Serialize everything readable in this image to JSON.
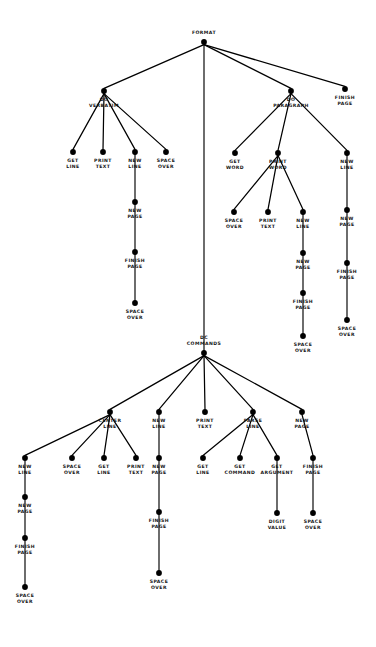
{
  "figure": {
    "title": "THE FORMAT PRO GRAM TREE",
    "type": "hierarchy-tree-diagram",
    "node_color": "#000000",
    "edge_color": "#000000",
    "background": "#ffffff"
  },
  "tree": {
    "root": "FORMAT",
    "nodes": [
      {
        "id": "n0",
        "label": "FORMAT",
        "x": 204,
        "y": 42,
        "label_dy": -12
      },
      {
        "id": "n1",
        "label": "DO\nVERBATIM",
        "x": 104,
        "y": 91,
        "label_dy": 6
      },
      {
        "id": "n2",
        "label": "DC\nCOMMANDS",
        "x": 204,
        "y": 353,
        "label_dy": -18
      },
      {
        "id": "n3",
        "label": "DO\nPARAGRAPH",
        "x": 291,
        "y": 91,
        "label_dy": 6
      },
      {
        "id": "n4",
        "label": "FINISH\nPAGE",
        "x": 345,
        "y": 89,
        "label_dy": 6
      },
      {
        "id": "v1",
        "label": "GET\nLINE",
        "x": 73,
        "y": 152,
        "label_dy": 6
      },
      {
        "id": "v2",
        "label": "PRINT\nTEXT",
        "x": 103,
        "y": 152,
        "label_dy": 6
      },
      {
        "id": "v3",
        "label": "NEW\nLINE",
        "x": 135,
        "y": 152,
        "label_dy": 6
      },
      {
        "id": "v4",
        "label": "SPACE\nOVER",
        "x": 166,
        "y": 152,
        "label_dy": 6
      },
      {
        "id": "v3a",
        "label": "NEW\nPAGE",
        "x": 135,
        "y": 202,
        "label_dy": 6
      },
      {
        "id": "v3b",
        "label": "FINISH\nPAGE",
        "x": 135,
        "y": 252,
        "label_dy": 6
      },
      {
        "id": "v3c",
        "label": "SPACE\nOVER",
        "x": 135,
        "y": 303,
        "label_dy": 6
      },
      {
        "id": "p1",
        "label": "GET\nWORD",
        "x": 235,
        "y": 153,
        "label_dy": 6
      },
      {
        "id": "p2",
        "label": "PRINT\nWORD",
        "x": 278,
        "y": 153,
        "label_dy": 6
      },
      {
        "id": "p3",
        "label": "NEW\nLINE",
        "x": 347,
        "y": 153,
        "label_dy": 6
      },
      {
        "id": "p2a",
        "label": "SPACE\nOVER",
        "x": 234,
        "y": 212,
        "label_dy": 6
      },
      {
        "id": "p2b",
        "label": "PRINT\nTEXT",
        "x": 268,
        "y": 212,
        "label_dy": 6
      },
      {
        "id": "p2c",
        "label": "NEW\nLINE",
        "x": 303,
        "y": 212,
        "label_dy": 6
      },
      {
        "id": "p2d",
        "label": "NEW\nPAGE",
        "x": 303,
        "y": 253,
        "label_dy": 6
      },
      {
        "id": "p2e",
        "label": "FINISH\nPAGE",
        "x": 303,
        "y": 293,
        "label_dy": 6
      },
      {
        "id": "p2f",
        "label": "SPACE\nOVER",
        "x": 303,
        "y": 336,
        "label_dy": 6
      },
      {
        "id": "p3a",
        "label": "NEW\nPAGE",
        "x": 347,
        "y": 210,
        "label_dy": 6
      },
      {
        "id": "p3b",
        "label": "FINISH\nPAGE",
        "x": 347,
        "y": 263,
        "label_dy": 6
      },
      {
        "id": "p3c",
        "label": "SPACE\nOVER",
        "x": 347,
        "y": 320,
        "label_dy": 6
      },
      {
        "id": "d1",
        "label": "CENTER\nLINE",
        "x": 110,
        "y": 412,
        "label_dy": 6
      },
      {
        "id": "d2",
        "label": "NEW\nLINE",
        "x": 159,
        "y": 412,
        "label_dy": 6
      },
      {
        "id": "d3",
        "label": "PRINT\nTEXT",
        "x": 205,
        "y": 412,
        "label_dy": 6
      },
      {
        "id": "d4",
        "label": "PARSE\nLINE",
        "x": 253,
        "y": 412,
        "label_dy": 6
      },
      {
        "id": "d5",
        "label": "NEW\nPAGE",
        "x": 302,
        "y": 412,
        "label_dy": 6
      },
      {
        "id": "c1",
        "label": "NEW\nLINE",
        "x": 25,
        "y": 458,
        "label_dy": 6
      },
      {
        "id": "c2",
        "label": "SPACE\nOVER",
        "x": 72,
        "y": 458,
        "label_dy": 6
      },
      {
        "id": "c3",
        "label": "GET\nLINE",
        "x": 104,
        "y": 458,
        "label_dy": 6
      },
      {
        "id": "c4",
        "label": "PRINT\nTEXT",
        "x": 136,
        "y": 458,
        "label_dy": 6
      },
      {
        "id": "c1a",
        "label": "NEW\nPAGE",
        "x": 25,
        "y": 497,
        "label_dy": 6
      },
      {
        "id": "c1b",
        "label": "FINISH\nPAGE",
        "x": 25,
        "y": 538,
        "label_dy": 6
      },
      {
        "id": "c1c",
        "label": "SPACE\nOVER",
        "x": 25,
        "y": 587,
        "label_dy": 6
      },
      {
        "id": "d2a",
        "label": "NEW\nPAGE",
        "x": 159,
        "y": 458,
        "label_dy": 6
      },
      {
        "id": "d2b",
        "label": "FINISH\nPAGE",
        "x": 159,
        "y": 512,
        "label_dy": 6
      },
      {
        "id": "d2c",
        "label": "SPACE\nOVER",
        "x": 159,
        "y": 573,
        "label_dy": 6
      },
      {
        "id": "d4a",
        "label": "GET\nLINE",
        "x": 203,
        "y": 458,
        "label_dy": 6
      },
      {
        "id": "d4b",
        "label": "GET\nCOMMAND",
        "x": 240,
        "y": 458,
        "label_dy": 6
      },
      {
        "id": "d4c",
        "label": "GET\nARGUMENT",
        "x": 277,
        "y": 458,
        "label_dy": 6
      },
      {
        "id": "d4d",
        "label": "DIGIT\nVALUE",
        "x": 277,
        "y": 513,
        "label_dy": 6
      },
      {
        "id": "d5a",
        "label": "FINISH\nPAGE",
        "x": 313,
        "y": 458,
        "label_dy": 6
      },
      {
        "id": "d5b",
        "label": "SPACE\nOVER",
        "x": 313,
        "y": 513,
        "label_dy": 6
      }
    ],
    "edges": [
      [
        "n0",
        "n1"
      ],
      [
        "n0",
        "n2"
      ],
      [
        "n0",
        "n3"
      ],
      [
        "n0",
        "n4"
      ],
      [
        "n1",
        "v1"
      ],
      [
        "n1",
        "v2"
      ],
      [
        "n1",
        "v3"
      ],
      [
        "n1",
        "v4"
      ],
      [
        "v3",
        "v3a"
      ],
      [
        "v3a",
        "v3b"
      ],
      [
        "v3b",
        "v3c"
      ],
      [
        "n3",
        "p1"
      ],
      [
        "n3",
        "p2"
      ],
      [
        "n3",
        "p3"
      ],
      [
        "p2",
        "p2a"
      ],
      [
        "p2",
        "p2b"
      ],
      [
        "p2",
        "p2c"
      ],
      [
        "p2c",
        "p2d"
      ],
      [
        "p2d",
        "p2e"
      ],
      [
        "p2e",
        "p2f"
      ],
      [
        "p3",
        "p3a"
      ],
      [
        "p3a",
        "p3b"
      ],
      [
        "p3b",
        "p3c"
      ],
      [
        "n2",
        "d1"
      ],
      [
        "n2",
        "d2"
      ],
      [
        "n2",
        "d3"
      ],
      [
        "n2",
        "d4"
      ],
      [
        "n2",
        "d5"
      ],
      [
        "d1",
        "c1"
      ],
      [
        "d1",
        "c2"
      ],
      [
        "d1",
        "c3"
      ],
      [
        "d1",
        "c4"
      ],
      [
        "c1",
        "c1a"
      ],
      [
        "c1a",
        "c1b"
      ],
      [
        "c1b",
        "c1c"
      ],
      [
        "d2",
        "d2a"
      ],
      [
        "d2a",
        "d2b"
      ],
      [
        "d2b",
        "d2c"
      ],
      [
        "d4",
        "d4a"
      ],
      [
        "d4",
        "d4b"
      ],
      [
        "d4",
        "d4c"
      ],
      [
        "d4c",
        "d4d"
      ],
      [
        "d5",
        "d5a"
      ],
      [
        "d5a",
        "d5b"
      ]
    ]
  }
}
